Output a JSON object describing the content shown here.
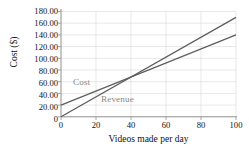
{
  "chart_data": {
    "type": "line",
    "title": "",
    "subtitle": "",
    "xlabel": "Videos made per day",
    "ylabel": "Cost ($)",
    "xlim": [
      0,
      100
    ],
    "ylim": [
      0,
      180
    ],
    "grid": true,
    "legend_position": "inline-annotation",
    "x_ticks": [
      "0",
      "20",
      "40",
      "60",
      "80",
      "100"
    ],
    "x_tick_values": [
      0,
      20,
      40,
      60,
      80,
      100
    ],
    "y_ticks": [
      "0",
      "20.00",
      "40.00",
      "60.00",
      "80.00",
      "100.00",
      "120.00",
      "140.00",
      "160.00",
      "180.00"
    ],
    "y_tick_values": [
      0,
      20,
      40,
      60,
      80,
      100,
      120,
      140,
      160,
      180
    ],
    "x": [
      0,
      100
    ],
    "series": [
      {
        "name": "Cost",
        "values": [
          20,
          140
        ],
        "slope": 1.2,
        "intercept": 20,
        "color": "#5e5e5e"
      },
      {
        "name": "Revenue",
        "values": [
          0,
          170
        ],
        "slope": 1.7,
        "intercept": 0,
        "color": "#5e5e5e"
      }
    ],
    "annotations": [
      {
        "text": "Cost",
        "x": 9,
        "y": 68
      },
      {
        "text": "Revenue",
        "x": 25,
        "y": 44
      }
    ],
    "colors": {
      "axis": "#9a9a9a",
      "grid": "#d8d8d8",
      "line": "#5e5e5e",
      "annotation_text": "#8a8a8a",
      "tick_text": "#111111",
      "background": "#ffffff"
    }
  }
}
